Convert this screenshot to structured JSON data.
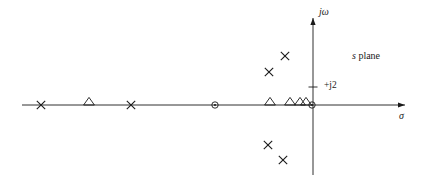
{
  "figure": {
    "title": "",
    "plane_label": "s plane",
    "plane_label_italic_part": "s",
    "plane_label_rest": " plane"
  },
  "axes": {
    "real": {
      "name": "sigma-axis",
      "label": "σ",
      "y_px": 105,
      "x_start_px": 22,
      "x_end_px": 405,
      "arrow": "right"
    },
    "imaginary": {
      "name": "jomega-axis",
      "label": "jω",
      "x_px": 313,
      "y_top_px": 18,
      "y_bottom_px": 175,
      "arrow": "up"
    },
    "ticks": [
      {
        "label": "+j2",
        "axis": "imaginary",
        "y_px": 87,
        "x_px": 313
      }
    ]
  },
  "chart_data": {
    "type": "scatter",
    "title": "s plane",
    "xlabel": "σ",
    "ylabel": "jω",
    "grid": false,
    "legend": "none",
    "origin_px": {
      "x": 313,
      "y": 105
    },
    "scale_note": "+j2 tick lies 18 px above the real axis",
    "series": [
      {
        "name": "poles",
        "marker": "x",
        "marker_label": "X",
        "points_px": [
          {
            "x": 41,
            "y": 105
          },
          {
            "x": 131,
            "y": 105
          },
          {
            "x": 285,
            "y": 56
          },
          {
            "x": 269,
            "y": 72
          },
          {
            "x": 268,
            "y": 145
          },
          {
            "x": 283,
            "y": 160
          }
        ]
      },
      {
        "name": "zeros-triangle",
        "marker": "triangle",
        "marker_label": "△",
        "points_px": [
          {
            "x": 89,
            "y": 105
          },
          {
            "x": 270,
            "y": 105
          },
          {
            "x": 290,
            "y": 105
          },
          {
            "x": 300,
            "y": 105
          },
          {
            "x": 306,
            "y": 105
          }
        ]
      },
      {
        "name": "zeros-circle",
        "marker": "circle-dot",
        "marker_label": "⊙",
        "points_px": [
          {
            "x": 215,
            "y": 105
          },
          {
            "x": 312,
            "y": 105
          }
        ]
      }
    ]
  }
}
